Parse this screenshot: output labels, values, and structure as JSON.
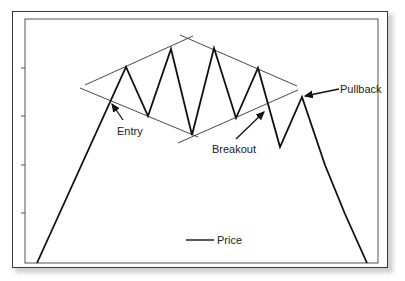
{
  "chart_data": {
    "type": "line",
    "title": "",
    "xlabel": "",
    "ylabel": "",
    "grid": false,
    "legend": {
      "position": "bottom-center",
      "entries": [
        "Price"
      ]
    },
    "series": [
      {
        "name": "Price",
        "points": [
          [
            37,
            263
          ],
          [
            126,
            67
          ],
          [
            148,
            116
          ],
          [
            171,
            49
          ],
          [
            192,
            135
          ],
          [
            214,
            48
          ],
          [
            236,
            118
          ],
          [
            258,
            68
          ],
          [
            280,
            147
          ],
          [
            302,
            97
          ],
          [
            325,
            165
          ],
          [
            345,
            214
          ],
          [
            367,
            263
          ]
        ]
      }
    ],
    "trendlines": [
      {
        "name": "upper-left",
        "from": [
          85,
          85
        ],
        "to": [
          193,
          36
        ]
      },
      {
        "name": "upper-right",
        "from": [
          180,
          35
        ],
        "to": [
          297,
          86
        ]
      },
      {
        "name": "lower-left",
        "from": [
          80,
          88
        ],
        "to": [
          198,
          137
        ]
      },
      {
        "name": "lower-right",
        "from": [
          178,
          143
        ],
        "to": [
          298,
          90
        ]
      }
    ],
    "annotations": [
      {
        "text": "Entry",
        "label_pos": [
          117,
          135
        ],
        "arrow_from": [
          123,
          120
        ],
        "arrow_to": [
          112,
          104
        ]
      },
      {
        "text": "Breakout",
        "label_pos": [
          212,
          153
        ],
        "arrow_from": [
          236,
          139
        ],
        "arrow_to": [
          264,
          112
        ]
      },
      {
        "text": "Pullback",
        "label_pos": [
          340,
          93
        ],
        "arrow_from": [
          339,
          89
        ],
        "arrow_to": [
          305,
          96
        ]
      }
    ],
    "y_ticks_px": [
      68,
      116,
      165,
      213
    ],
    "plot_area_px": {
      "left": 25,
      "top": 19,
      "right": 378,
      "bottom": 263
    }
  },
  "labels": {
    "entry": "Entry",
    "breakout": "Breakout",
    "pullback": "Pullback",
    "legend_price": "Price"
  }
}
